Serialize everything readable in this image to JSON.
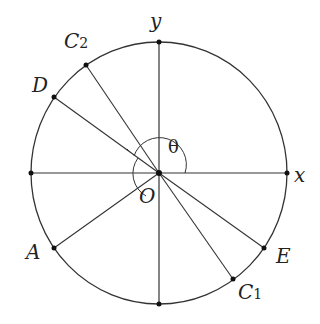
{
  "diagram": {
    "type": "unit-circle-geometry",
    "axes": {
      "x_label": "x",
      "y_label": "y"
    },
    "origin_label": "O",
    "angle_label": "θ",
    "points": [
      {
        "id": "C2",
        "label": "C",
        "subscript": "2"
      },
      {
        "id": "D",
        "label": "D",
        "subscript": ""
      },
      {
        "id": "A",
        "label": "A",
        "subscript": ""
      },
      {
        "id": "E",
        "label": "E",
        "subscript": ""
      },
      {
        "id": "C1",
        "label": "C",
        "subscript": "1"
      }
    ],
    "segments_from_origin": [
      "C2",
      "D",
      "A",
      "E",
      "C1"
    ],
    "colors": {
      "stroke": "#333333",
      "point": "#111111",
      "text": "#222222"
    }
  }
}
